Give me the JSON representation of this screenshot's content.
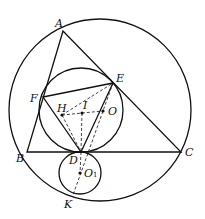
{
  "diagram": {
    "type": "geometry",
    "stroke_color": "#111111",
    "points": {
      "A": {
        "label": "A",
        "x": 63,
        "y": 31
      },
      "B": {
        "label": "B",
        "x": 27,
        "y": 152
      },
      "C": {
        "label": "C",
        "x": 181,
        "y": 152
      },
      "D": {
        "label": "D",
        "x": 81,
        "y": 152
      },
      "E": {
        "label": "E",
        "x": 113,
        "y": 83
      },
      "F": {
        "label": "F",
        "x": 43,
        "y": 97
      },
      "H": {
        "label": "H",
        "x": 62,
        "y": 115
      },
      "I": {
        "label": "I",
        "x": 82,
        "y": 113
      },
      "O": {
        "label": "O",
        "x": 103,
        "y": 111
      },
      "O1": {
        "label": "O",
        "sub": "1",
        "x": 80,
        "y": 173
      },
      "K": {
        "label": "K",
        "x": 73,
        "y": 195
      }
    },
    "circles": [
      {
        "name": "circumcircle",
        "cx": 100,
        "cy": 110,
        "r": 91
      },
      {
        "name": "incircle",
        "cx": 81,
        "cy": 110,
        "r": 42
      },
      {
        "name": "small-circle",
        "cx": 80,
        "cy": 173,
        "r": 21
      }
    ]
  }
}
